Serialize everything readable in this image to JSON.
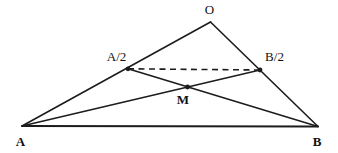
{
  "figure": {
    "width": 338,
    "height": 153,
    "background": "#ffffff",
    "stroke_color": "#1c1c1c",
    "label_color": "#111111"
  },
  "diagram": {
    "type": "geometry",
    "dot_radius": 2.4,
    "points": {
      "a": {
        "label": "A",
        "x": 22,
        "y": 126,
        "dot": false,
        "bold": true,
        "label_x": 20.5,
        "label_y": 145.5
      },
      "b": {
        "label": "B",
        "x": 318,
        "y": 126.5,
        "dot": false,
        "bold": true,
        "label_x": 317,
        "label_y": 145.5
      },
      "o": {
        "label": "O",
        "x": 210.5,
        "y": 22,
        "dot": false,
        "bold": false,
        "label_x": 209.5,
        "label_y": 13.5
      },
      "a2": {
        "label": "A/2",
        "x": 128,
        "y": 68.8,
        "dot": true,
        "bold": false,
        "label_x": 116.5,
        "label_y": 60.5
      },
      "b2": {
        "label": "B/2",
        "x": 260,
        "y": 70,
        "dot": true,
        "bold": false,
        "label_x": 274.5,
        "label_y": 60.5
      },
      "m": {
        "label": "M",
        "x": 187.5,
        "y": 87,
        "dot": true,
        "bold": true,
        "label_x": 183,
        "label_y": 103.5
      }
    },
    "edges": [
      {
        "from": "a",
        "to": "o",
        "style": "solid",
        "role": "side-ao"
      },
      {
        "from": "o",
        "to": "b",
        "style": "solid",
        "role": "side-ob"
      },
      {
        "from": "a",
        "to": "b",
        "style": "base",
        "role": "base-ab"
      },
      {
        "from": "a",
        "to": "b2",
        "style": "solid",
        "role": "cevian-a-b2"
      },
      {
        "from": "b",
        "to": "a2",
        "style": "solid",
        "role": "cevian-b-a2"
      },
      {
        "from": "a2",
        "to": "b2",
        "style": "dashed",
        "role": "midsegment-a2-b2"
      }
    ]
  }
}
